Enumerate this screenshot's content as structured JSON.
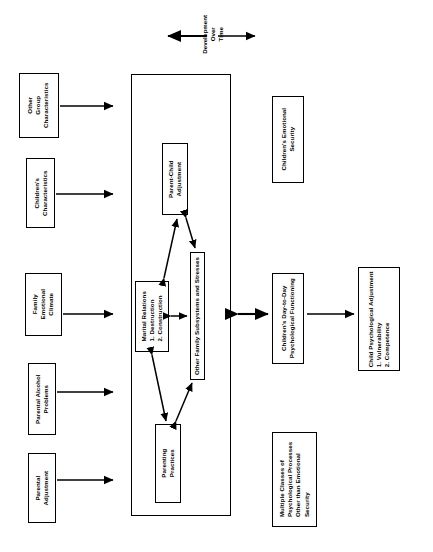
{
  "figure": {
    "orientation": "rotated-90-ccw",
    "header": {
      "label": "Development\nOver\nTime",
      "line1": "Development",
      "line2": "Over",
      "line3": "Time",
      "arrow_style": "double-headed"
    },
    "inputs": [
      {
        "id": "other-group-characteristics",
        "line1": "Other",
        "line2": "Group",
        "line3": "Characteristics"
      },
      {
        "id": "childrens-characteristics",
        "line1": "Children's",
        "line2": "Characteristics",
        "line3": ""
      },
      {
        "id": "family-emotional-climate",
        "line1": "Family",
        "line2": "Emotional",
        "line3": "Climate"
      },
      {
        "id": "parental-alcohol-problems",
        "line1": "Parental Alcohol",
        "line2": "Problems",
        "line3": ""
      },
      {
        "id": "parental-adjustment",
        "line1": "Parental",
        "line2": "Adjustment",
        "line3": ""
      }
    ],
    "family_system": {
      "container_label": "",
      "nodes": [
        {
          "id": "parent-child-adjustment",
          "line1": "Parent-Child",
          "line2": "Adjustment",
          "line3": "",
          "line4": ""
        },
        {
          "id": "marital-relations",
          "line1": "Marital Relations",
          "line2": "1. Destruction",
          "line3": "2. Construction",
          "line4": ""
        },
        {
          "id": "other-family-subsystems",
          "line1": "Other Family Subsystems and Stresses",
          "line2": "",
          "line3": "",
          "line4": ""
        },
        {
          "id": "parenting-practices",
          "line1": "Parenting",
          "line2": "Practices",
          "line3": "",
          "line4": ""
        }
      ]
    },
    "outcomes": [
      {
        "id": "childrens-emotional-security",
        "line1": "Children's Emotional",
        "line2": "Security",
        "line3": "",
        "line4": ""
      },
      {
        "id": "childrens-day-to-day-psychological-functioning",
        "line1": "Children's Day-to-Day",
        "line2": "Psychological Functioning",
        "line3": "",
        "line4": ""
      },
      {
        "id": "multiple-classes-of-psychological-processes",
        "line1": "Multiple Classes of",
        "line2": "Psychological Processes",
        "line3": "Other than Emotional",
        "line4": "Security"
      },
      {
        "id": "child-psychological-adjustment",
        "line1": "Child Psychological Adjustment",
        "line2": "1. Vulnerability",
        "line3": "2. Competence",
        "line4": ""
      }
    ],
    "colors": {
      "stroke": "#000000",
      "background": "#ffffff"
    }
  }
}
